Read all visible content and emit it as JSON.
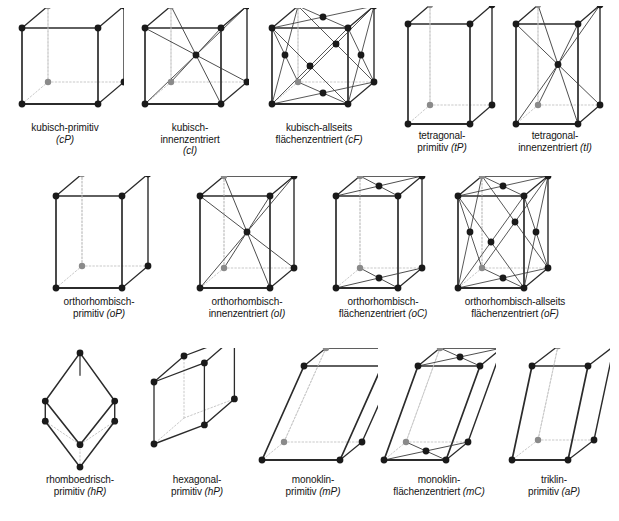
{
  "figure": {
    "title_visible": false,
    "background_color": "#ffffff",
    "style": {
      "edge_solid_color": "#2b2b2b",
      "edge_hidden_color": "#c9c9c9",
      "diagonal_color": "#3a3a3a",
      "node_front_color": "#1a1a1a",
      "node_back_color": "#8a8a8a",
      "node_radius": 3.4,
      "node_back_radius": 3.2
    }
  },
  "rows": [
    {
      "name": "row-cubic-tetragonal",
      "cells": [
        {
          "id": "cP",
          "name": "kubisch-primitiv",
          "symbol": "(cP)",
          "caption_lines": [
            "kubisch-primitiv",
            "(cP)"
          ],
          "caption_italic_line": 1,
          "x": 6,
          "y": 8,
          "w": 118,
          "h": 112,
          "caption_x": 4,
          "caption_y": 122,
          "caption_w": 122,
          "geometry": {
            "type": "prism",
            "a": 76,
            "b": 76,
            "c": 76,
            "skew_x": 26,
            "skew_y": -22,
            "origin_x": 16,
            "origin_y": 96,
            "centering": "P",
            "diagonals": "none"
          }
        },
        {
          "id": "cI",
          "name": "kubisch-innenzentriert",
          "symbol": "(cI)",
          "caption_lines": [
            "kubisch-",
            "innenzentriert",
            "(cI)"
          ],
          "caption_italic_line": 2,
          "x": 131,
          "y": 8,
          "w": 118,
          "h": 112,
          "caption_x": 128,
          "caption_y": 122,
          "caption_w": 124,
          "geometry": {
            "type": "prism",
            "a": 76,
            "b": 76,
            "c": 76,
            "skew_x": 26,
            "skew_y": -22,
            "origin_x": 14,
            "origin_y": 96,
            "centering": "I",
            "diagonals": "body"
          }
        },
        {
          "id": "cF",
          "name": "kubisch-allseits flächenzentriert",
          "symbol": "(cF)",
          "caption_lines": [
            "kubisch-allseits",
            "flächenzentriert (cF)"
          ],
          "caption_italic_line": 1,
          "x": 258,
          "y": 8,
          "w": 122,
          "h": 112,
          "caption_x": 250,
          "caption_y": 122,
          "caption_w": 138,
          "geometry": {
            "type": "prism",
            "a": 76,
            "b": 76,
            "c": 76,
            "skew_x": 26,
            "skew_y": -22,
            "origin_x": 14,
            "origin_y": 96,
            "centering": "F",
            "diagonals": "faces"
          }
        },
        {
          "id": "tP",
          "name": "tetragonal-primitiv",
          "symbol": "(tP)",
          "caption_lines": [
            "tetragonal-",
            "primitiv (tP)"
          ],
          "caption_italic_line": 1,
          "x": 392,
          "y": 6,
          "w": 108,
          "h": 124,
          "caption_x": 384,
          "caption_y": 130,
          "caption_w": 116,
          "geometry": {
            "type": "prism",
            "a": 62,
            "b": 62,
            "c": 100,
            "skew_x": 22,
            "skew_y": -19,
            "origin_x": 16,
            "origin_y": 118,
            "centering": "P",
            "diagonals": "none"
          }
        },
        {
          "id": "tI",
          "name": "tetragonal-innenzentriert",
          "symbol": "(tI)",
          "caption_lines": [
            "tetragonal-",
            "innenzentriert (tI)"
          ],
          "caption_italic_line": 1,
          "x": 502,
          "y": 6,
          "w": 112,
          "h": 124,
          "caption_x": 492,
          "caption_y": 130,
          "caption_w": 126,
          "geometry": {
            "type": "prism",
            "a": 62,
            "b": 62,
            "c": 100,
            "skew_x": 22,
            "skew_y": -19,
            "origin_x": 14,
            "origin_y": 118,
            "centering": "I",
            "diagonals": "body"
          }
        }
      ]
    },
    {
      "name": "row-orthorhombic",
      "cells": [
        {
          "id": "oP",
          "name": "orthorhombisch-primitiv",
          "symbol": "(oP)",
          "caption_lines": [
            "orthorhombisch-",
            "primitiv (oP)"
          ],
          "caption_italic_line": 1,
          "x": 42,
          "y": 176,
          "w": 116,
          "h": 118,
          "caption_x": 32,
          "caption_y": 296,
          "caption_w": 134,
          "geometry": {
            "type": "prism",
            "a": 66,
            "b": 52,
            "c": 92,
            "skew_x": 26,
            "skew_y": -22,
            "origin_x": 14,
            "origin_y": 112,
            "centering": "P",
            "diagonals": "none"
          }
        },
        {
          "id": "oI",
          "name": "orthorhombisch-innenzentriert",
          "symbol": "(oI)",
          "caption_lines": [
            "orthorhombisch-",
            "innenzentriert (oI)"
          ],
          "caption_italic_line": 1,
          "x": 186,
          "y": 176,
          "w": 120,
          "h": 118,
          "caption_x": 176,
          "caption_y": 296,
          "caption_w": 142,
          "geometry": {
            "type": "prism",
            "a": 70,
            "b": 48,
            "c": 92,
            "skew_x": 24,
            "skew_y": -20,
            "origin_x": 14,
            "origin_y": 112,
            "centering": "I",
            "diagonals": "body"
          }
        },
        {
          "id": "oC",
          "name": "orthorhombisch-flächenzentriert",
          "symbol": "(oC)",
          "caption_lines": [
            "orthorhombisch-",
            "flächenzentriert (oC)"
          ],
          "caption_italic_line": 1,
          "x": 322,
          "y": 176,
          "w": 112,
          "h": 118,
          "caption_x": 312,
          "caption_y": 296,
          "caption_w": 142,
          "geometry": {
            "type": "prism",
            "a": 62,
            "b": 46,
            "c": 92,
            "skew_x": 24,
            "skew_y": -20,
            "origin_x": 14,
            "origin_y": 112,
            "centering": "C",
            "diagonals": "base"
          }
        },
        {
          "id": "oF",
          "name": "orthorhombisch-allseits flächenzentriert",
          "symbol": "(oF)",
          "caption_lines": [
            "orthorhombisch-allseits",
            "flächenzentriert (oF)"
          ],
          "caption_italic_line": 1,
          "x": 444,
          "y": 176,
          "w": 122,
          "h": 118,
          "caption_x": 434,
          "caption_y": 296,
          "caption_w": 162,
          "geometry": {
            "type": "prism",
            "a": 66,
            "b": 48,
            "c": 92,
            "skew_x": 24,
            "skew_y": -20,
            "origin_x": 14,
            "origin_y": 112,
            "centering": "F",
            "diagonals": "faces"
          }
        }
      ]
    },
    {
      "name": "row-low-symmetry",
      "cells": [
        {
          "id": "hR",
          "name": "rhomboedrisch-primitiv",
          "symbol": "(hR)",
          "caption_lines": [
            "rhomboedrisch-",
            "primitiv (hR)"
          ],
          "caption_italic_line": 1,
          "x": 24,
          "y": 348,
          "w": 112,
          "h": 124,
          "caption_x": 14,
          "caption_y": 474,
          "caption_w": 132,
          "geometry": {
            "type": "rhombohedron",
            "r": 56,
            "squash": 0.62,
            "origin_x": 56,
            "origin_y": 62,
            "centering": "P"
          }
        },
        {
          "id": "hP",
          "name": "hexagonal-primitiv",
          "symbol": "(hP)",
          "caption_lines": [
            "hexagonal-",
            "primitiv (hP)"
          ],
          "caption_italic_line": 1,
          "x": 142,
          "y": 348,
          "w": 110,
          "h": 124,
          "caption_x": 136,
          "caption_y": 474,
          "caption_w": 122,
          "geometry": {
            "type": "hex-prism",
            "a": 56,
            "c": 62,
            "skew_x": 30,
            "skew_y": -26,
            "origin_x": 12,
            "origin_y": 96,
            "centering": "P"
          }
        },
        {
          "id": "mP",
          "name": "monoklin-primitiv",
          "symbol": "(mP)",
          "caption_lines": [
            "monoklin-",
            "primitiv (mP)"
          ],
          "caption_italic_line": 1,
          "x": 256,
          "y": 348,
          "w": 122,
          "h": 124,
          "caption_x": 250,
          "caption_y": 474,
          "caption_w": 126,
          "geometry": {
            "type": "oblique-prism",
            "a": 78,
            "b": 46,
            "c": 94,
            "beta_shift": 42,
            "skew_x": 22,
            "skew_y": -18,
            "origin_x": 6,
            "origin_y": 112,
            "centering": "P"
          }
        },
        {
          "id": "mC",
          "name": "monoklin-flächenzentriert",
          "symbol": "(mC)",
          "caption_lines": [
            "monoklin-",
            "flächenzentriert (mC)"
          ],
          "caption_italic_line": 1,
          "x": 374,
          "y": 348,
          "w": 122,
          "h": 124,
          "caption_x": 368,
          "caption_y": 474,
          "caption_w": 142,
          "geometry": {
            "type": "oblique-prism",
            "a": 62,
            "b": 44,
            "c": 94,
            "beta_shift": 34,
            "skew_x": 22,
            "skew_y": -18,
            "origin_x": 10,
            "origin_y": 112,
            "centering": "C"
          }
        },
        {
          "id": "aP",
          "name": "triklin-primitiv",
          "symbol": "(aP)",
          "caption_lines": [
            "triklin-",
            "primitiv (aP)"
          ],
          "caption_italic_line": 1,
          "x": 498,
          "y": 348,
          "w": 112,
          "h": 124,
          "caption_x": 496,
          "caption_y": 474,
          "caption_w": 116,
          "geometry": {
            "type": "oblique-prism",
            "a": 56,
            "b": 44,
            "c": 94,
            "beta_shift": 20,
            "skew_x": 26,
            "skew_y": -20,
            "origin_x": 14,
            "origin_y": 112,
            "centering": "P"
          }
        }
      ]
    }
  ]
}
